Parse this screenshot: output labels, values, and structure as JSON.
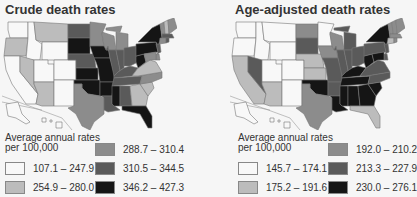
{
  "figures": [
    {
      "title": "Crude death rates",
      "legend": {
        "heading_line1": "Average annual rates",
        "heading_line2": "per 100,000",
        "classes": [
          {
            "range": "107.1 – 247.9",
            "color": "#f8f8f8"
          },
          {
            "range": "254.9 – 280.0",
            "color": "#bcbcbc"
          },
          {
            "range": "288.7 – 310.4",
            "color": "#8c8c8c"
          },
          {
            "range": "310.5 – 344.5",
            "color": "#5a5a5a"
          },
          {
            "range": "346.2 – 427.3",
            "color": "#151515"
          }
        ]
      }
    },
    {
      "title": "Age-adjusted death rates",
      "legend": {
        "heading_line1": "Average annual rates",
        "heading_line2": "per 100,000",
        "classes": [
          {
            "range": "145.7 – 174.1",
            "color": "#f8f8f8"
          },
          {
            "range": "175.2 – 191.6",
            "color": "#bcbcbc"
          },
          {
            "range": "192.0 – 210.2",
            "color": "#8c8c8c"
          },
          {
            "range": "213.3 – 227.9",
            "color": "#5a5a5a"
          },
          {
            "range": "230.0 – 276.1",
            "color": "#151515"
          }
        ]
      }
    }
  ],
  "chart_data": [
    {
      "type": "choropleth",
      "title": "Crude death rates",
      "legend_title": "Average annual rates per 100,000",
      "classes": [
        "107.1 – 247.9",
        "254.9 – 280.0",
        "288.7 – 310.4",
        "310.5 – 344.5",
        "346.2 – 427.3"
      ],
      "state_class": {
        "WA": 0,
        "OR": 1,
        "CA": 0,
        "ID": 0,
        "NV": 1,
        "MT": 1,
        "WY": 0,
        "UT": 0,
        "AZ": 1,
        "CO": 0,
        "NM": 0,
        "ND": 3,
        "SD": 4,
        "NE": 3,
        "KS": 4,
        "OK": 4,
        "TX": 2,
        "MN": 2,
        "IA": 4,
        "MO": 4,
        "AR": 4,
        "LA": 3,
        "WI": 2,
        "IL": 3,
        "MI": 2,
        "IN": 3,
        "OH": 3,
        "KY": 3,
        "TN": 3,
        "MS": 4,
        "AL": 3,
        "GA": 1,
        "FL": 4,
        "SC": 1,
        "NC": 2,
        "VA": 1,
        "WV": 4,
        "PA": 4,
        "NY": 4,
        "VT": 2,
        "NH": 1,
        "ME": 2,
        "MA": 3,
        "CT": 2,
        "RI": 3,
        "NJ": 3,
        "DE": 2,
        "MD": 2,
        "AK": 0,
        "HI": 0
      }
    },
    {
      "type": "choropleth",
      "title": "Age-adjusted death rates",
      "legend_title": "Average annual rates per 100,000",
      "classes": [
        "145.7 – 174.1",
        "175.2 – 191.6",
        "192.0 – 210.2",
        "213.3 – 227.9",
        "230.0 – 276.1"
      ],
      "state_class": {
        "WA": 0,
        "OR": 0,
        "CA": 1,
        "ID": 0,
        "NV": 3,
        "MT": 0,
        "WY": 0,
        "UT": 0,
        "AZ": 1,
        "CO": 0,
        "NM": 0,
        "ND": 2,
        "SD": 3,
        "NE": 1,
        "KS": 1,
        "OK": 4,
        "TX": 2,
        "MN": 0,
        "IA": 2,
        "MO": 3,
        "AR": 3,
        "LA": 4,
        "WI": 2,
        "IL": 3,
        "MI": 3,
        "IN": 3,
        "OH": 3,
        "KY": 4,
        "TN": 4,
        "MS": 4,
        "AL": 4,
        "GA": 4,
        "FL": 1,
        "SC": 4,
        "NC": 3,
        "VA": 3,
        "WV": 4,
        "PA": 3,
        "NY": 4,
        "VT": 2,
        "NH": 2,
        "ME": 2,
        "MA": 2,
        "CT": 1,
        "RI": 2,
        "NJ": 3,
        "DE": 3,
        "MD": 4,
        "AK": 0,
        "HI": 0
      }
    }
  ]
}
